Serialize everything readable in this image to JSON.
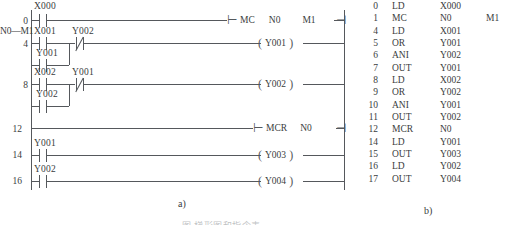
{
  "figure": {
    "caption_a": "a)",
    "caption_b": "b)",
    "bottom_caption": "图                     梯形图和指令表"
  },
  "ladder": {
    "mc_scope_label": "N0—M1",
    "rungs": [
      {
        "step": "0",
        "contacts": [
          {
            "type": "no",
            "name": "X000"
          }
        ],
        "instruction": {
          "mnemonic": "MC",
          "operand1": "N0",
          "operand2": "M1"
        }
      },
      {
        "step": "4",
        "contacts": [
          {
            "type": "no",
            "name": "X001"
          },
          {
            "type": "nc",
            "name": "Y002"
          }
        ],
        "branch": {
          "type": "no",
          "name": "Y001"
        },
        "coil": "Y001"
      },
      {
        "step": "8",
        "contacts": [
          {
            "type": "no",
            "name": "X002"
          },
          {
            "type": "nc",
            "name": "Y001"
          }
        ],
        "branch": {
          "type": "no",
          "name": "Y002"
        },
        "coil": "Y002"
      },
      {
        "step": "12",
        "contacts": [],
        "instruction": {
          "mnemonic": "MCR",
          "operand1": "N0",
          "operand2": ""
        }
      },
      {
        "step": "14",
        "contacts": [
          {
            "type": "no",
            "name": "Y001"
          }
        ],
        "coil": "Y003"
      },
      {
        "step": "16",
        "contacts": [
          {
            "type": "no",
            "name": "Y002"
          }
        ],
        "coil": "Y004"
      }
    ]
  },
  "instruction_list": {
    "rows": [
      {
        "step": "0",
        "mnemonic": "LD",
        "operand1": "X000",
        "operand2": ""
      },
      {
        "step": "1",
        "mnemonic": "MC",
        "operand1": "N0",
        "operand2": "M1"
      },
      {
        "step": "4",
        "mnemonic": "LD",
        "operand1": "X001",
        "operand2": ""
      },
      {
        "step": "5",
        "mnemonic": "OR",
        "operand1": "Y001",
        "operand2": ""
      },
      {
        "step": "6",
        "mnemonic": "ANI",
        "operand1": "Y002",
        "operand2": ""
      },
      {
        "step": "7",
        "mnemonic": "OUT",
        "operand1": "Y001",
        "operand2": ""
      },
      {
        "step": "8",
        "mnemonic": "LD",
        "operand1": "X002",
        "operand2": ""
      },
      {
        "step": "9",
        "mnemonic": "OR",
        "operand1": "Y002",
        "operand2": ""
      },
      {
        "step": "10",
        "mnemonic": "ANI",
        "operand1": "Y001",
        "operand2": ""
      },
      {
        "step": "11",
        "mnemonic": "OUT",
        "operand1": "Y002",
        "operand2": ""
      },
      {
        "step": "12",
        "mnemonic": "MCR",
        "operand1": "N0",
        "operand2": ""
      },
      {
        "step": "14",
        "mnemonic": "LD",
        "operand1": "Y001",
        "operand2": ""
      },
      {
        "step": "15",
        "mnemonic": "OUT",
        "operand1": "Y003",
        "operand2": ""
      },
      {
        "step": "16",
        "mnemonic": "LD",
        "operand1": "Y002",
        "operand2": ""
      },
      {
        "step": "17",
        "mnemonic": "OUT",
        "operand1": "Y004",
        "operand2": ""
      }
    ]
  }
}
